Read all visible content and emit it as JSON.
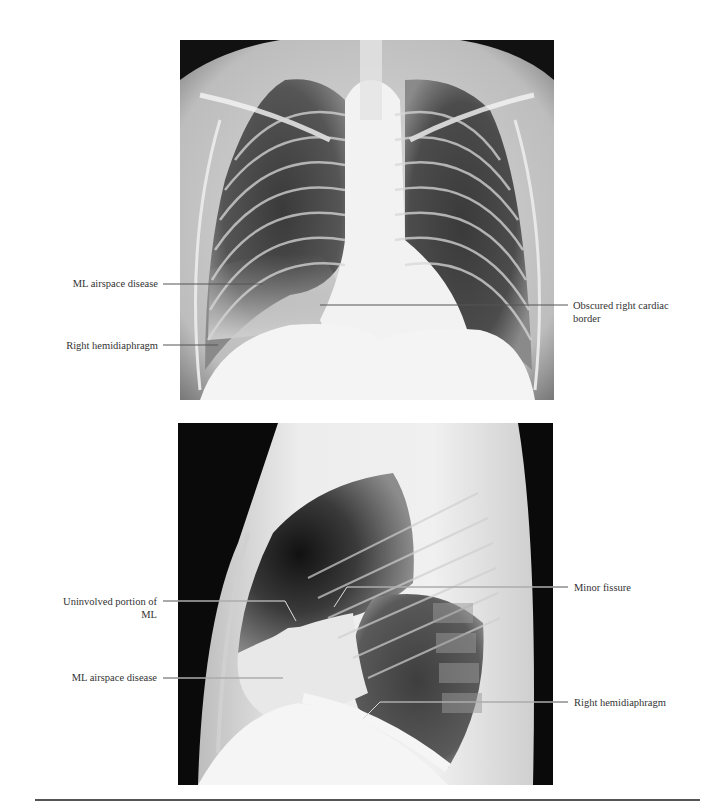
{
  "figures": [
    {
      "view": "PA chest radiograph",
      "labels": [
        {
          "id": "pa-ml-airspace",
          "text": "ML airspace disease",
          "side": "left"
        },
        {
          "id": "pa-right-hemidiaphragm",
          "text": "Right hemidiaphragm",
          "side": "left"
        },
        {
          "id": "pa-obscured-cardiac",
          "text": "Obscured right cardiac border",
          "line1": "Obscured right cardiac",
          "line2": "border",
          "side": "right"
        }
      ]
    },
    {
      "view": "Lateral chest radiograph",
      "labels": [
        {
          "id": "lat-uninvolved",
          "text": "Uninvolved portion of ML",
          "line1": "Uninvolved portion of",
          "line2": "ML",
          "side": "left"
        },
        {
          "id": "lat-ml-airspace",
          "text": "ML airspace disease",
          "side": "left"
        },
        {
          "id": "lat-minor-fissure",
          "text": "Minor fissure",
          "side": "right"
        },
        {
          "id": "lat-right-hemidiaphragm",
          "text": "Right hemidiaphragm",
          "side": "right"
        }
      ]
    }
  ],
  "colors": {
    "leader_dark": "#555555",
    "leader_light": "#d8d8d8",
    "rule": "#555555"
  }
}
